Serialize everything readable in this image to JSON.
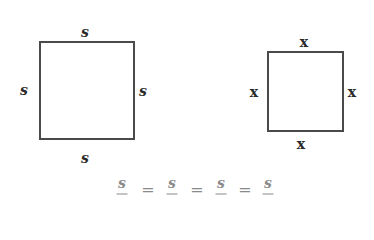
{
  "figures": {
    "square_s": {
      "labels": {
        "top": "s",
        "left": "s",
        "right": "s",
        "bottom": "s"
      }
    },
    "square_x": {
      "labels": {
        "top": "x",
        "left": "x",
        "right": "x",
        "bottom": "x"
      }
    }
  },
  "equation": {
    "terms": [
      "s",
      "=",
      "s",
      "=",
      "s",
      "=",
      "s"
    ]
  },
  "colors": {
    "line": "#4a4a4a",
    "label": "#2a2a2a",
    "equation": "#8a8a8a"
  }
}
